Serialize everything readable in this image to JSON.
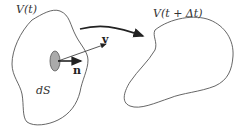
{
  "diagram": {
    "volume_initial_label": "V(t)",
    "volume_later_label": "V(t + Δt)",
    "surface_element_label": "dS",
    "velocity_label": "v",
    "normal_label": "n",
    "colors": {
      "outline": "#555555",
      "surface_patch": "#aaaaaa",
      "arrow": "#222222",
      "background": "#ffffff"
    }
  }
}
